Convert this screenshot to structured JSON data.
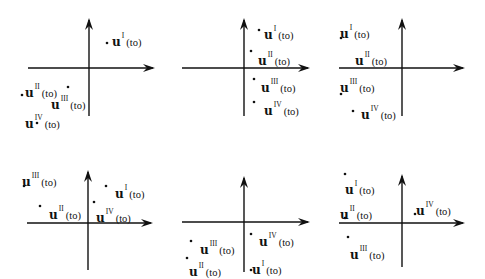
{
  "figure": {
    "vector_symbol": "u",
    "argument": "(to)",
    "panels": [
      {
        "id": "panel-1",
        "axes": {
          "vx": 89,
          "vtop": 18,
          "vbottom": 116,
          "hy": 68,
          "hleft": 28,
          "hright": 155
        },
        "points": [
          {
            "name": "I",
            "dot": [
              107,
              43
            ],
            "label_pos": [
              112,
              30
            ]
          },
          {
            "name": "II",
            "dot": [
              22,
              95
            ],
            "label_pos": [
              25,
              81
            ]
          },
          {
            "name": "III",
            "dot": [
              68,
              87
            ],
            "label_pos": [
              51,
              93
            ]
          },
          {
            "name": "IV",
            "dot": [
              37,
              123
            ],
            "label_pos": [
              25,
              112
            ]
          }
        ]
      },
      {
        "id": "panel-2",
        "axes": {
          "vx": 244,
          "vtop": 18,
          "vbottom": 116,
          "hy": 68,
          "hleft": 182,
          "hright": 310
        },
        "points": [
          {
            "name": "I",
            "dot": [
              259,
              30
            ],
            "label_pos": [
              264,
              23
            ]
          },
          {
            "name": "II",
            "dot": [
              251,
              51
            ],
            "label_pos": [
              258,
              49
            ]
          },
          {
            "name": "III",
            "dot": [
              254,
              79
            ],
            "label_pos": [
              261,
              76
            ]
          },
          {
            "name": "IV",
            "dot": [
              254,
              102
            ],
            "label_pos": [
              264,
              99
            ]
          }
        ]
      },
      {
        "id": "panel-3",
        "axes": {
          "vx": 402,
          "vtop": 18,
          "vbottom": 116,
          "hy": 68,
          "hleft": 339,
          "hright": 465
        },
        "points": [
          {
            "name": "I",
            "dot": [
              341,
              38
            ],
            "label_pos": [
              340,
              22
            ]
          },
          {
            "name": "II",
            "dot": null,
            "label_pos": [
              355,
              49
            ]
          },
          {
            "name": "III",
            "dot": [
              341,
              94
            ],
            "label_pos": [
              340,
              76
            ]
          },
          {
            "name": "IV",
            "dot": [
              353,
              111
            ],
            "label_pos": [
              361,
              103
            ]
          }
        ]
      },
      {
        "id": "panel-4",
        "axes": {
          "vx": 88,
          "vtop": 170,
          "vbottom": 270,
          "hy": 223,
          "hleft": 27,
          "hright": 153
        },
        "points": [
          {
            "name": "III",
            "dot": [
              24,
              186
            ],
            "label_pos": [
              22,
              170
            ]
          },
          {
            "name": "II",
            "dot": [
              40,
              206
            ],
            "label_pos": [
              49,
              203
            ]
          },
          {
            "name": "I",
            "dot": [
              106,
              186
            ],
            "label_pos": [
              115,
              182
            ]
          },
          {
            "name": "IV",
            "dot": [
              94,
              202
            ],
            "label_pos": [
              96,
              206
            ]
          }
        ]
      },
      {
        "id": "panel-5",
        "axes": {
          "vx": 244,
          "vtop": 176,
          "vbottom": 272,
          "hy": 222,
          "hleft": 182,
          "hright": 310
        },
        "points": [
          {
            "name": "IV",
            "dot": [
              251,
              234
            ],
            "label_pos": [
              259,
              230
            ]
          },
          {
            "name": "III",
            "dot": [
              191,
              241
            ],
            "label_pos": [
              200,
              238
            ]
          },
          {
            "name": "II",
            "dot": [
              187,
              258
            ],
            "label_pos": [
              189,
              260
            ]
          },
          {
            "name": "I",
            "dot": [
              251,
              270
            ],
            "label_pos": [
              252,
              258
            ]
          }
        ]
      },
      {
        "id": "panel-6",
        "axes": {
          "vx": 402,
          "vtop": 174,
          "vbottom": 267,
          "hy": 223,
          "hleft": 339,
          "hright": 465
        },
        "points": [
          {
            "name": "I",
            "dot": [
              345,
              174
            ],
            "label_pos": [
              345,
              178
            ]
          },
          {
            "name": "II",
            "dot": [
              345,
              218
            ],
            "label_pos": [
              340,
              203
            ]
          },
          {
            "name": "III",
            "dot": [
              348,
              237
            ],
            "label_pos": [
              350,
              243
            ]
          },
          {
            "name": "IV",
            "dot": [
              415,
              214
            ],
            "label_pos": [
              416,
              199
            ]
          }
        ]
      }
    ]
  }
}
